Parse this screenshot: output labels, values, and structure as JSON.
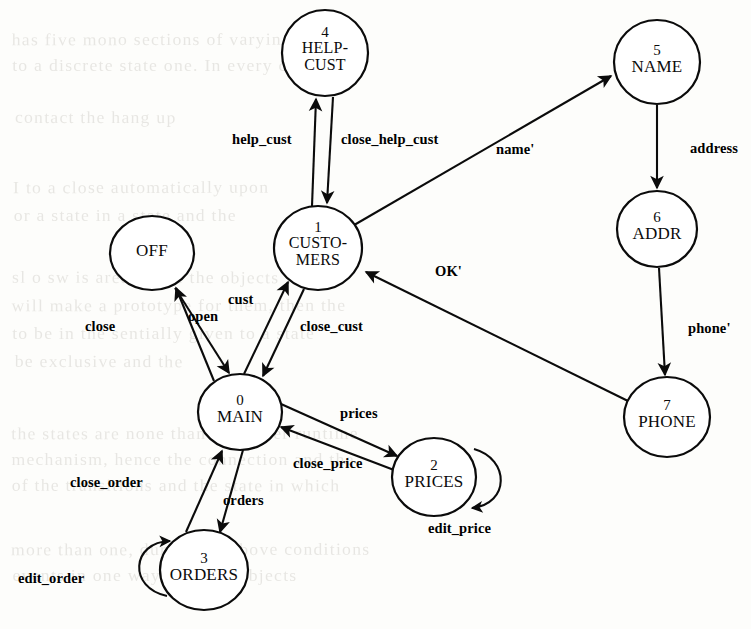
{
  "figure": {
    "kind": "state-transition-diagram",
    "background_color": "#fdfdfb",
    "ink_color": "#0b0b0b"
  },
  "states": [
    {
      "id": "off",
      "number": "",
      "name": "OFF",
      "name_lines": [
        "OFF"
      ],
      "cx": 152,
      "cy": 253,
      "rx": 42,
      "ry": 37
    },
    {
      "id": "main",
      "number": "0",
      "name": "MAIN",
      "name_lines": [
        "MAIN"
      ],
      "cx": 240,
      "cy": 412,
      "rx": 42,
      "ry": 38
    },
    {
      "id": "customers",
      "number": "1",
      "name": "CUSTOMERS",
      "name_lines": [
        "CUSTO-",
        "MERS"
      ],
      "cx": 318,
      "cy": 248,
      "rx": 44,
      "ry": 42
    },
    {
      "id": "prices",
      "number": "2",
      "name": "PRICES",
      "name_lines": [
        "PRICES"
      ],
      "cx": 434,
      "cy": 477,
      "rx": 42,
      "ry": 39
    },
    {
      "id": "orders",
      "number": "3",
      "name": "ORDERS",
      "name_lines": [
        "ORDERS"
      ],
      "cx": 204,
      "cy": 570,
      "rx": 44,
      "ry": 40
    },
    {
      "id": "helpcust",
      "number": "4",
      "name": "HELP-CUST",
      "name_lines": [
        "HELP-",
        "CUST"
      ],
      "cx": 325,
      "cy": 53,
      "rx": 43,
      "ry": 43
    },
    {
      "id": "name",
      "number": "5",
      "name": "NAME",
      "name_lines": [
        "NAME"
      ],
      "cx": 657,
      "cy": 62,
      "rx": 43,
      "ry": 42
    },
    {
      "id": "addr",
      "number": "6",
      "name": "ADDR",
      "name_lines": [
        "ADDR"
      ],
      "cx": 657,
      "cy": 229,
      "rx": 40,
      "ry": 38
    },
    {
      "id": "phone",
      "number": "7",
      "name": "PHONE",
      "name_lines": [
        "PHONE"
      ],
      "cx": 667,
      "cy": 417,
      "rx": 43,
      "ry": 40
    }
  ],
  "transitions": [
    {
      "id": "close",
      "label": "close",
      "from": "main",
      "to": "off",
      "label_x": 85,
      "label_y": 318
    },
    {
      "id": "open",
      "label": "open",
      "from": "off",
      "to": "main",
      "label_x": 188,
      "label_y": 308
    },
    {
      "id": "cust",
      "label": "cust",
      "from": "main",
      "to": "customers",
      "label_x": 228,
      "label_y": 291
    },
    {
      "id": "close_cust",
      "label": "close_cust",
      "from": "customers",
      "to": "main",
      "label_x": 300,
      "label_y": 318
    },
    {
      "id": "help_cust",
      "label": "help_cust",
      "from": "customers",
      "to": "helpcust",
      "label_x": 232,
      "label_y": 131
    },
    {
      "id": "close_help_cust",
      "label": "close_help_cust",
      "from": "helpcust",
      "to": "customers",
      "label_x": 341,
      "label_y": 131
    },
    {
      "id": "name_prime",
      "label": "name'",
      "from": "customers",
      "to": "name",
      "label_x": 496,
      "label_y": 141
    },
    {
      "id": "address",
      "label": "address",
      "from": "name",
      "to": "addr",
      "label_x": 690,
      "label_y": 140
    },
    {
      "id": "phone_prime",
      "label": "phone'",
      "from": "addr",
      "to": "phone",
      "label_x": 688,
      "label_y": 320
    },
    {
      "id": "ok_prime",
      "label": "OK'",
      "from": "phone",
      "to": "customers",
      "label_x": 435,
      "label_y": 263
    },
    {
      "id": "prices",
      "label": "prices",
      "from": "main",
      "to": "prices",
      "label_x": 340,
      "label_y": 405
    },
    {
      "id": "close_price",
      "label": "close_price",
      "from": "prices",
      "to": "main",
      "label_x": 293,
      "label_y": 455
    },
    {
      "id": "edit_price",
      "label": "edit_price",
      "from": "prices",
      "to": "prices",
      "label_x": 428,
      "label_y": 520
    },
    {
      "id": "orders",
      "label": "orders",
      "from": "main",
      "to": "orders",
      "label_x": 223,
      "label_y": 492
    },
    {
      "id": "close_order",
      "label": "close_order",
      "from": "orders",
      "to": "main",
      "label_x": 70,
      "label_y": 474
    },
    {
      "id": "edit_order",
      "label": "edit_order",
      "from": "orders",
      "to": "orders",
      "label_x": 18,
      "label_y": 570
    }
  ],
  "background_bleed": [
    {
      "text": "has five mono sections of varying sizes",
      "x": 18,
      "y": 30,
      "size": 17
    },
    {
      "text": "to a discrete state one. In every case",
      "x": 18,
      "y": 56,
      "size": 17
    },
    {
      "text": "contact the hang up",
      "x": 18,
      "y": 108,
      "size": 17
    },
    {
      "text": "I to a close automatically upon",
      "x": 18,
      "y": 178,
      "size": 17
    },
    {
      "text": "or a state in a state and the",
      "x": 18,
      "y": 206,
      "size": 17
    },
    {
      "text": "sl o sw is area to see the objects with",
      "x": 18,
      "y": 268,
      "size": 17
    },
    {
      "text": "will make a prototype for them, then the",
      "x": 18,
      "y": 296,
      "size": 17
    },
    {
      "text": "to be in the sentially given to a state",
      "x": 18,
      "y": 324,
      "size": 17
    },
    {
      "text": "be exclusive and the",
      "x": 18,
      "y": 352,
      "size": 17
    },
    {
      "text": "the states are none than one inner runtime",
      "x": 18,
      "y": 424,
      "size": 17
    },
    {
      "text": "mechanism, hence the connection and the",
      "x": 18,
      "y": 450,
      "size": 17
    },
    {
      "text": "of the transitions and the state in which",
      "x": 18,
      "y": 476,
      "size": 17
    },
    {
      "text": "more than one, during the above conditions",
      "x": 18,
      "y": 540,
      "size": 17
    },
    {
      "text": "events in one way a subset objects",
      "x": 18,
      "y": 566,
      "size": 17
    }
  ]
}
